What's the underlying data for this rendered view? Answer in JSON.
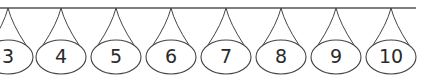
{
  "diagram": {
    "line": {
      "x1": 0,
      "x2": 416,
      "y": 8,
      "color": "#555555"
    },
    "ornaments": [
      {
        "label": "3",
        "cx": 8
      },
      {
        "label": "4",
        "cx": 61
      },
      {
        "label": "5",
        "cx": 116
      },
      {
        "label": "6",
        "cx": 171
      },
      {
        "label": "7",
        "cx": 226
      },
      {
        "label": "8",
        "cx": 281
      },
      {
        "label": "9",
        "cx": 336
      },
      {
        "label": "10",
        "cx": 391
      }
    ],
    "oval": {
      "cy": 57,
      "rx": 25,
      "ry": 17
    },
    "stroke_color": "#444444"
  }
}
